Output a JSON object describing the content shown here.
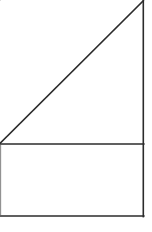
{
  "image": {
    "width": 152,
    "height": 232,
    "background_color": "#ffffff",
    "stroke_color": "#2b2b2b",
    "faint_stroke_color": "#8d8d8d",
    "style": "hand-drawn line figure",
    "title": "Right triangle above rectangle"
  },
  "figure": {
    "shapes": [
      {
        "name": "right-triangle",
        "type": "polygon",
        "points": "0,143 143,1 143,143",
        "vertices": [
          {
            "label": "left-vertex",
            "x": 0,
            "y": 143
          },
          {
            "label": "apex-top-right",
            "x": 143,
            "y": 1
          },
          {
            "label": "right-angle-vertex",
            "x": 143,
            "y": 143
          }
        ],
        "fill": "#ffffff"
      },
      {
        "name": "rectangle",
        "type": "polygon",
        "points": "0,144 143,144 143,216 0,216",
        "vertices": [
          {
            "label": "top-left",
            "x": 0,
            "y": 144
          },
          {
            "label": "top-right",
            "x": 143,
            "y": 144
          },
          {
            "label": "bottom-right",
            "x": 143,
            "y": 216
          },
          {
            "label": "bottom-left",
            "x": 0,
            "y": 216
          }
        ],
        "fill": "#ffffff"
      }
    ],
    "segments": [
      {
        "name": "hypotenuse",
        "x1": 0,
        "y1": 143,
        "x2": 143,
        "y2": 1,
        "weight": "main"
      },
      {
        "name": "right-vertical-edge",
        "x1": 143.2,
        "y1": 0,
        "x2": 143.2,
        "y2": 216,
        "weight": "main"
      },
      {
        "name": "shared-horizontal-edge",
        "x1": 0,
        "y1": 144,
        "x2": 143.6,
        "y2": 144,
        "weight": "main"
      },
      {
        "name": "rectangle-bottom-edge",
        "x1": 0,
        "y1": 216,
        "x2": 143.6,
        "y2": 216,
        "weight": "main"
      },
      {
        "name": "rectangle-left-edge",
        "x1": 0.6,
        "y1": 145,
        "x2": 0.6,
        "y2": 215,
        "weight": "faint"
      }
    ]
  }
}
